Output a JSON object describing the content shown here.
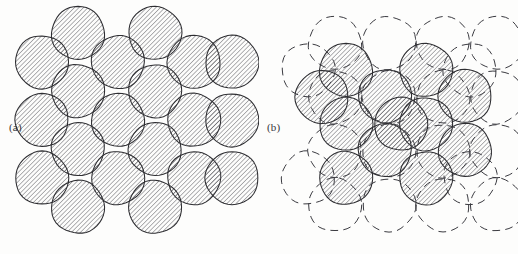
{
  "figure": {
    "background_color": "#fdfdfc",
    "ink_color": "#2d2d31",
    "hatch_color": "#4a4a50",
    "dashed_color": "#3a3a40",
    "width": 518,
    "height": 254
  },
  "panels": [
    {
      "id": "a",
      "label": "(a)",
      "description": "close-packed array of hatched circles",
      "circle_style": "solid-outline-hatched",
      "radius": 26.5,
      "hatch_angle_deg": 45,
      "hatch_spacing_px": 3.2,
      "circle_count": 20
    },
    {
      "id": "b",
      "label": "(b)",
      "description": "dashed reference lattice with displaced hatched circles",
      "circle_style": "dashed-reference-plus-solid-hatched",
      "radius": 26.5,
      "hatch_angle_deg": 45,
      "hatch_spacing_px": 3.2,
      "dashed_circle_count": 20,
      "solid_circle_count": 12
    }
  ],
  "chart_data": {
    "type": "scatter",
    "title": "",
    "xlabel": "",
    "ylabel": "",
    "panel_a": {
      "marker": "hatched-circle",
      "radius": 26.5,
      "points": [
        [
          78,
          33
        ],
        [
          155,
          33
        ],
        [
          42,
          62
        ],
        [
          118,
          62
        ],
        [
          194,
          62
        ],
        [
          232,
          62
        ],
        [
          78,
          91
        ],
        [
          155,
          91
        ],
        [
          42,
          120
        ],
        [
          118,
          120
        ],
        [
          194,
          120
        ],
        [
          232,
          120
        ],
        [
          78,
          149
        ],
        [
          155,
          149
        ],
        [
          42,
          178
        ],
        [
          118,
          178
        ],
        [
          194,
          178
        ],
        [
          232,
          178
        ],
        [
          78,
          207
        ],
        [
          155,
          207
        ]
      ]
    },
    "panel_b": {
      "dashed": {
        "marker": "dashed-circle",
        "radius": 26.5,
        "points": [
          [
            76,
            43
          ],
          [
            130,
            43
          ],
          [
            184,
            43
          ],
          [
            238,
            43
          ],
          [
            76,
            97
          ],
          [
            130,
            97
          ],
          [
            184,
            97
          ],
          [
            238,
            97
          ],
          [
            76,
            151
          ],
          [
            130,
            151
          ],
          [
            184,
            151
          ],
          [
            238,
            151
          ],
          [
            76,
            205
          ],
          [
            130,
            205
          ],
          [
            184,
            205
          ],
          [
            238,
            205
          ],
          [
            49,
            70
          ],
          [
            211,
            70
          ],
          [
            49,
            178
          ],
          [
            211,
            178
          ]
        ]
      },
      "solid": {
        "marker": "hatched-circle",
        "radius": 26.5,
        "points": [
          [
            87,
            70
          ],
          [
            167,
            70
          ],
          [
            126,
            96
          ],
          [
            206,
            96
          ],
          [
            87,
            124
          ],
          [
            167,
            124
          ],
          [
            126,
            150
          ],
          [
            206,
            150
          ],
          [
            87,
            178
          ],
          [
            167,
            178
          ],
          [
            63,
            97
          ],
          [
            142,
            124
          ]
        ]
      }
    }
  }
}
